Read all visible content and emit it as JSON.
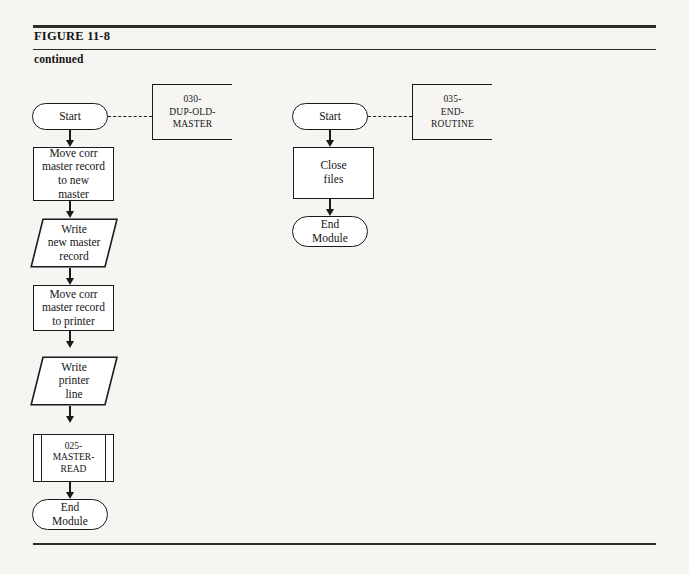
{
  "figure": {
    "title": "FIGURE 11-8",
    "subtitle": "continued"
  },
  "colors": {
    "page_background": "#f6f5f2",
    "ink": "#1a1a1a",
    "node_fill": "#ffffff"
  },
  "flowcharts": [
    {
      "id": "dup-old-master",
      "annotation": {
        "lines": [
          "030-",
          "DUP-OLD-",
          "MASTER"
        ],
        "text": "030-DUP-OLD-MASTER"
      },
      "nodes": [
        {
          "id": "start",
          "shape": "terminal",
          "lines": [
            "Start"
          ]
        },
        {
          "id": "move-new",
          "shape": "process",
          "lines": [
            "Move corr",
            "master record",
            "to new",
            "master"
          ]
        },
        {
          "id": "write-new",
          "shape": "io",
          "lines": [
            "Write",
            "new master",
            "record"
          ]
        },
        {
          "id": "move-printer",
          "shape": "process",
          "lines": [
            "Move corr",
            "master record",
            "to printer"
          ]
        },
        {
          "id": "write-line",
          "shape": "io",
          "lines": [
            "Write",
            "printer",
            "line"
          ]
        },
        {
          "id": "master-read",
          "shape": "predefined",
          "lines": [
            "025-",
            "MASTER-",
            "READ"
          ]
        },
        {
          "id": "end",
          "shape": "terminal",
          "lines": [
            "End",
            "Module"
          ]
        }
      ]
    },
    {
      "id": "end-routine",
      "annotation": {
        "lines": [
          "035-",
          "END-",
          "ROUTINE"
        ],
        "text": "035-END-ROUTINE"
      },
      "nodes": [
        {
          "id": "start",
          "shape": "terminal",
          "lines": [
            "Start"
          ]
        },
        {
          "id": "close-files",
          "shape": "process",
          "lines": [
            "Close",
            "files"
          ]
        },
        {
          "id": "end",
          "shape": "terminal",
          "lines": [
            "End",
            "Module"
          ]
        }
      ]
    }
  ]
}
